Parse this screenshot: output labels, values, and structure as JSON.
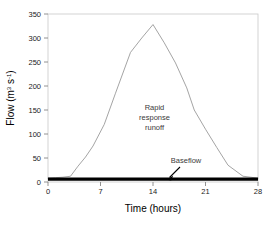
{
  "chart_data": {
    "type": "line",
    "title": "",
    "xlabel": "Time (hours)",
    "ylabel": "Flow (m3 s-1)",
    "ylabel_parts": {
      "prefix": "Flow (m",
      "sup1": "3",
      "mid": " s",
      "sup2": "-1",
      "suffix": ")"
    },
    "xlim": [
      0,
      28
    ],
    "ylim": [
      0,
      350
    ],
    "xticks": [
      "0",
      "7",
      "14",
      "21",
      "28"
    ],
    "xtick_values": [
      0,
      7,
      14,
      21,
      28
    ],
    "yticks": [
      "0",
      "50",
      "100",
      "150",
      "200",
      "250",
      "300",
      "350"
    ],
    "ytick_values": [
      0,
      50,
      100,
      150,
      200,
      250,
      300,
      350
    ],
    "grid": false,
    "legend_position": "none",
    "series": [
      {
        "name": "Total storm hydrograph",
        "color": "#9a9a9a",
        "x": [
          0,
          1,
          2,
          3,
          4,
          5,
          6,
          7.5,
          9,
          11,
          12.5,
          14,
          15.5,
          17,
          18.5,
          19.5,
          21,
          22.5,
          24,
          26,
          28
        ],
        "values": [
          8,
          9,
          10,
          12,
          33,
          52,
          75,
          120,
          185,
          270,
          300,
          328,
          290,
          248,
          196,
          150,
          110,
          72,
          35,
          12,
          8
        ]
      },
      {
        "name": "Baseflow",
        "color": "#000000",
        "x": [
          0,
          28
        ],
        "values": [
          6,
          6
        ]
      }
    ],
    "annotations": [
      {
        "name": "rapid-response-runoff",
        "lines": [
          "Rapid",
          "response",
          "runoff"
        ],
        "x": 14.2,
        "y": 150
      },
      {
        "name": "baseflow",
        "lines": [
          "Baseflow"
        ],
        "x": 19.0,
        "y": 38
      }
    ]
  }
}
